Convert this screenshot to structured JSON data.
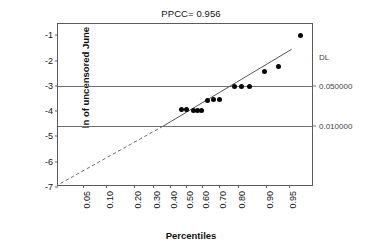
{
  "chart_data": {
    "type": "scatter",
    "title": "PPCC= 0.956",
    "xlabel": "Percentiles",
    "ylabel": "ln of uncensored June",
    "xscale": "normal-probability",
    "xlim": [
      0.02,
      0.98
    ],
    "ylim": [
      -7.0,
      -0.55
    ],
    "grid": true,
    "legend": null,
    "xticks": [
      0.05,
      0.1,
      0.2,
      0.3,
      0.4,
      0.5,
      0.6,
      0.7,
      0.8,
      0.9,
      0.95
    ],
    "xticklabels": [
      "0.05",
      "0.10",
      "0.20",
      "0.30",
      "0.40",
      "0.50",
      "0.60",
      "0.70",
      "0.80",
      "0.90",
      "0.95"
    ],
    "yticks": [
      -1,
      -2,
      -3,
      -4,
      -5,
      -6,
      -7
    ],
    "yticklabels": [
      "-1",
      "-2",
      "-3",
      "-4",
      "-5",
      "-6",
      "-7"
    ],
    "points": [
      {
        "x": 0.47,
        "y": -3.95
      },
      {
        "x": 0.505,
        "y": -3.95
      },
      {
        "x": 0.548,
        "y": -3.96
      },
      {
        "x": 0.572,
        "y": -3.96
      },
      {
        "x": 0.597,
        "y": -3.96
      },
      {
        "x": 0.637,
        "y": -3.56
      },
      {
        "x": 0.672,
        "y": -3.55
      },
      {
        "x": 0.706,
        "y": -3.55
      },
      {
        "x": 0.782,
        "y": -3.02
      },
      {
        "x": 0.812,
        "y": -3.02
      },
      {
        "x": 0.846,
        "y": -3.02
      },
      {
        "x": 0.896,
        "y": -2.42
      },
      {
        "x": 0.932,
        "y": -2.25
      },
      {
        "x": 0.967,
        "y": -1.0
      }
    ],
    "fit_line": {
      "label": "regression fit",
      "solid_from": {
        "x": 0.355,
        "y": -4.6
      },
      "solid_to": {
        "x": 0.955,
        "y": -1.55
      },
      "dashed_from": {
        "x": 0.022,
        "y": -6.86
      },
      "dashed_to": {
        "x": 0.355,
        "y": -4.6
      },
      "style_solid": "solid",
      "style_dashed": "dashed"
    },
    "reference_lines": [
      {
        "y": -3.0,
        "right_label": "0.050000"
      },
      {
        "y": -4.6,
        "right_label": "0.010000"
      }
    ],
    "right_axis": {
      "header": "DL",
      "header_y": -1.85,
      "labels": [
        "0.050000",
        "0.010000"
      ]
    },
    "colors": {
      "marker": "#050505",
      "line": "#555555",
      "grid": "#6e6e6e",
      "frame": "#5b5b5b",
      "text": "#111111",
      "right_text": "#3f3f3f",
      "background": "#ffffff"
    }
  }
}
